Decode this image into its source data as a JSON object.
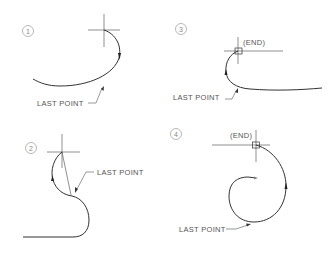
{
  "figure": {
    "panels": [
      {
        "id": "1",
        "number_label": "1",
        "last_point_label": "LAST POINT",
        "end_label": ""
      },
      {
        "id": "2",
        "number_label": "2",
        "last_point_label": "LAST POINT",
        "end_label": ""
      },
      {
        "id": "3",
        "number_label": "3",
        "last_point_label": "LAST POINT",
        "end_label": "(END)"
      },
      {
        "id": "4",
        "number_label": "4",
        "last_point_label": "LAST POINT",
        "end_label": "(END)"
      }
    ],
    "colors": {
      "line": "#333333",
      "text": "#555555",
      "circle": "#9a9a9a"
    }
  }
}
